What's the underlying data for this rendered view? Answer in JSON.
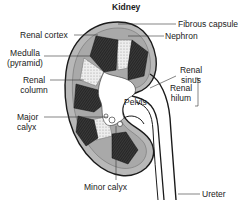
{
  "diagram": {
    "title": "Kidney",
    "labels": {
      "renal_cortex": "Renal cortex",
      "medulla_line1": "Medulla",
      "medulla_line2": "(pyramid)",
      "renal_column_line1": "Renal",
      "renal_column_line2": "column",
      "major_calyx_line1": "Major",
      "major_calyx_line2": "calyx",
      "fibrous_capsule": "Fibrous capsule",
      "nephron": "Nephron",
      "renal_sinus_line1": "Renal",
      "renal_sinus_line2": "sinus",
      "renal_hilum_line1": "Renal",
      "renal_hilum_line2": "hilum",
      "pelvis": "Pelvis",
      "minor_calyx": "Minor calyx",
      "ureter": "Ureter"
    },
    "colors": {
      "outline": "#1a1a1a",
      "cortex": "#b8b8b8",
      "pyramid": "#2b2b2b",
      "column": "#e6e6e6",
      "background": "#ffffff"
    }
  }
}
